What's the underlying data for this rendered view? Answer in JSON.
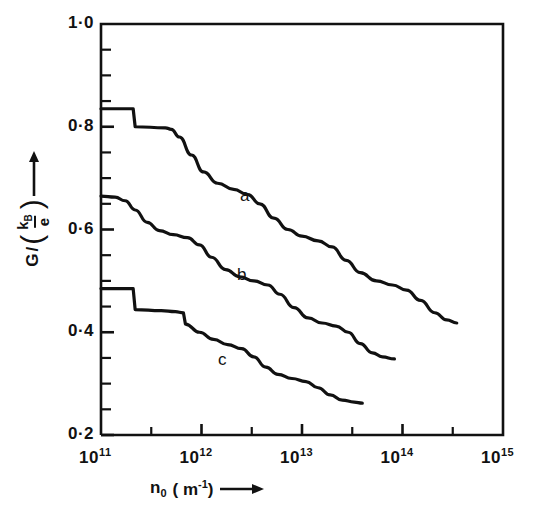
{
  "figure": {
    "axes": {
      "y_axis_label_numerator": "G",
      "y_axis_label_slash": "/",
      "y_axis_label_frac_num": "k",
      "y_axis_label_frac_num_sub": "B",
      "y_axis_label_frac_den": "e",
      "y_axis_arrow": "up-arrow",
      "x_axis_label_symbol": "n",
      "x_axis_label_sub": "0",
      "x_axis_label_unit": "( m",
      "x_axis_label_unit_sup": "-1",
      "x_axis_label_unit_close": ")",
      "x_axis_arrow": "right-arrow"
    },
    "y_tick_labels": [
      {
        "text": "1·0",
        "value": 1.0
      },
      {
        "text": "0·8",
        "value": 0.8
      },
      {
        "text": "0·6",
        "value": 0.6
      },
      {
        "text": "0·4",
        "value": 0.4
      },
      {
        "text": "0·2",
        "value": 0.2
      }
    ],
    "x_tick_labels": [
      {
        "mantissa": "10",
        "exponent": "11",
        "value": 11
      },
      {
        "mantissa": "10",
        "exponent": "12",
        "value": 12
      },
      {
        "mantissa": "10",
        "exponent": "13",
        "value": 13
      },
      {
        "mantissa": "10",
        "exponent": "14",
        "value": 14
      },
      {
        "mantissa": "10",
        "exponent": "15",
        "value": 15
      }
    ],
    "curve_labels": [
      {
        "text": "a",
        "x": 240,
        "y": 186
      },
      {
        "text": "b",
        "x": 237,
        "y": 265
      },
      {
        "text": "c",
        "x": 218,
        "y": 350
      }
    ],
    "line_color": "#111111",
    "background_color": "#ffffff"
  },
  "chart_data": {
    "type": "line",
    "title": "",
    "xlabel": "n_0 (m^-1)",
    "ylabel": "G/(k_B/e)",
    "xscale": "log",
    "xlim": [
      100000000000.0,
      1000000000000000.0
    ],
    "ylim": [
      0.2,
      1.0
    ],
    "yticks": [
      0.2,
      0.4,
      0.6,
      0.8,
      1.0
    ],
    "ytick_minor_step": 0.05,
    "xticks": [
      100000000000.0,
      1000000000000.0,
      10000000000000.0,
      100000000000000.0,
      1000000000000000.0
    ],
    "xtick_minor": "half-decade",
    "grid": false,
    "legend": "inline-curve-labels",
    "series": [
      {
        "name": "a",
        "points": [
          [
            11.0,
            0.835
          ],
          [
            11.3,
            0.835
          ],
          [
            11.32,
            0.835
          ],
          [
            11.34,
            0.8
          ],
          [
            11.64,
            0.798
          ],
          [
            11.7,
            0.795
          ],
          [
            11.78,
            0.78
          ],
          [
            11.9,
            0.745
          ],
          [
            12.02,
            0.712
          ],
          [
            12.16,
            0.69
          ],
          [
            12.32,
            0.678
          ],
          [
            12.46,
            0.668
          ],
          [
            12.58,
            0.65
          ],
          [
            12.72,
            0.622
          ],
          [
            12.86,
            0.6
          ],
          [
            13.0,
            0.587
          ],
          [
            13.16,
            0.578
          ],
          [
            13.3,
            0.566
          ],
          [
            13.44,
            0.54
          ],
          [
            13.58,
            0.516
          ],
          [
            13.74,
            0.5
          ],
          [
            13.9,
            0.492
          ],
          [
            14.04,
            0.482
          ],
          [
            14.18,
            0.462
          ],
          [
            14.32,
            0.438
          ],
          [
            14.44,
            0.424
          ],
          [
            14.54,
            0.418
          ]
        ]
      },
      {
        "name": "b",
        "points": [
          [
            11.0,
            0.665
          ],
          [
            11.14,
            0.663
          ],
          [
            11.24,
            0.656
          ],
          [
            11.34,
            0.638
          ],
          [
            11.46,
            0.614
          ],
          [
            11.58,
            0.598
          ],
          [
            11.72,
            0.59
          ],
          [
            11.86,
            0.584
          ],
          [
            11.98,
            0.57
          ],
          [
            12.1,
            0.546
          ],
          [
            12.24,
            0.522
          ],
          [
            12.38,
            0.508
          ],
          [
            12.52,
            0.5
          ],
          [
            12.66,
            0.492
          ],
          [
            12.78,
            0.474
          ],
          [
            12.92,
            0.448
          ],
          [
            13.06,
            0.428
          ],
          [
            13.2,
            0.418
          ],
          [
            13.34,
            0.412
          ],
          [
            13.46,
            0.4
          ],
          [
            13.58,
            0.378
          ],
          [
            13.7,
            0.36
          ],
          [
            13.8,
            0.352
          ],
          [
            13.92,
            0.348
          ]
        ]
      },
      {
        "name": "c",
        "points": [
          [
            11.0,
            0.485
          ],
          [
            11.3,
            0.485
          ],
          [
            11.32,
            0.485
          ],
          [
            11.34,
            0.444
          ],
          [
            11.6,
            0.442
          ],
          [
            11.74,
            0.44
          ],
          [
            11.82,
            0.438
          ],
          [
            11.84,
            0.416
          ],
          [
            11.98,
            0.4
          ],
          [
            12.12,
            0.386
          ],
          [
            12.26,
            0.376
          ],
          [
            12.4,
            0.368
          ],
          [
            12.52,
            0.352
          ],
          [
            12.64,
            0.332
          ],
          [
            12.76,
            0.318
          ],
          [
            12.9,
            0.31
          ],
          [
            13.04,
            0.304
          ],
          [
            13.16,
            0.292
          ],
          [
            13.28,
            0.278
          ],
          [
            13.4,
            0.268
          ],
          [
            13.52,
            0.264
          ],
          [
            13.6,
            0.262
          ]
        ]
      }
    ]
  }
}
